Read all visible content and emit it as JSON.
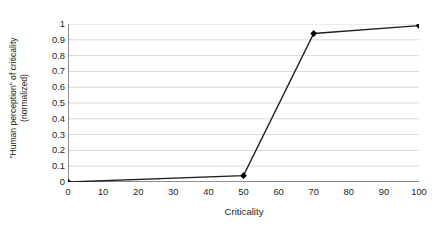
{
  "chart_data": {
    "type": "line",
    "title": "",
    "xlabel": "Criticality",
    "ylabel": "\"Human perception\" of criticality (normalized)",
    "ylabel_lines": [
      "\"Human perception\" of criticality",
      "(normalized)"
    ],
    "x": [
      0,
      50,
      70,
      100
    ],
    "values": [
      0,
      0.04,
      0.94,
      0.99
    ],
    "series": [
      {
        "name": "\"Human perception\" of criticality",
        "x": [
          0,
          50,
          70,
          100
        ],
        "values": [
          0,
          0.04,
          0.94,
          0.99
        ]
      }
    ],
    "xlim": [
      0,
      100
    ],
    "ylim": [
      0,
      1
    ],
    "xticks": [
      0,
      10,
      20,
      30,
      40,
      50,
      60,
      70,
      80,
      90,
      100
    ],
    "xtick_labels": [
      "0",
      "10",
      "20",
      "30",
      "40",
      "50",
      "60",
      "70",
      "80",
      "90",
      "100"
    ],
    "yticks": [
      0,
      0.1,
      0.2,
      0.3,
      0.4,
      0.5,
      0.6,
      0.7,
      0.8,
      0.9,
      1
    ],
    "ytick_labels": [
      "0",
      "0.1",
      "0.2",
      "0.3",
      "0.4",
      "0.5",
      "0.6",
      "0.7",
      "0.8",
      "0.9",
      "1"
    ],
    "grid": "horizontal",
    "legend": "none",
    "marker": "diamond",
    "colors": {
      "line": "#231f20",
      "marker": "#000000",
      "gridline": "#d9d9d9",
      "axis": "#231f20",
      "text": "#231f20",
      "background": "#ffffff"
    }
  }
}
